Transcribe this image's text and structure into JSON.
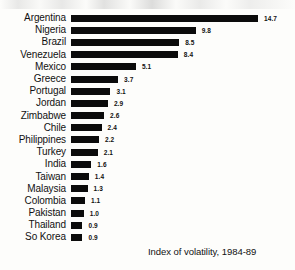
{
  "chart_data": {
    "type": "bar",
    "orientation": "horizontal",
    "title": "",
    "subtitle": "",
    "caption": "Index of volatility, 1984-89",
    "xlabel": "",
    "ylabel": "",
    "xlim": [
      0,
      14.7
    ],
    "grid": false,
    "legend": null,
    "bar_color": "#0b0b0b",
    "background_color": "#fdfdfb",
    "text_color": "#111111",
    "categories": [
      "Argentina",
      "Nigeria",
      "Brazil",
      "Venezuela",
      "Mexico",
      "Greece",
      "Portugal",
      "Jordan",
      "Zimbabwe",
      "Chile",
      "Philippines",
      "Turkey",
      "India",
      "Taiwan",
      "Malaysia",
      "Colombia",
      "Pakistan",
      "Thailand",
      "So Korea"
    ],
    "values": [
      14.7,
      9.8,
      8.5,
      8.4,
      5.1,
      3.7,
      3.1,
      2.9,
      2.6,
      2.4,
      2.2,
      2.1,
      1.6,
      1.4,
      1.3,
      1.1,
      1.0,
      0.9,
      0.9
    ],
    "value_labels": [
      "14.7",
      "9.8",
      "8.5",
      "8.4",
      "5.1",
      "3.7",
      "3.1",
      "2.9",
      "2.6",
      "2.4",
      "2.2",
      "2.1",
      "1.6",
      "1.4",
      "1.3",
      "1.1",
      "1.0",
      "0.9",
      "0.9"
    ]
  }
}
